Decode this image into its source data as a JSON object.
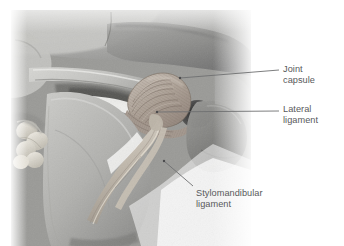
{
  "figure": {
    "kind": "anatomical-photograph",
    "background_color": "#ffffff",
    "label_color": "#58595b",
    "leader_color": "#6e6f71"
  },
  "labels": [
    {
      "id": "joint-capsule",
      "line1": "Joint",
      "line2": "capsule",
      "leader": {
        "x1": 180,
        "y1": 78,
        "x2": 279,
        "y2": 70
      }
    },
    {
      "id": "lateral-ligament",
      "line1": "Lateral",
      "line2": "ligament",
      "leader": {
        "x1": 157,
        "y1": 112,
        "x2": 279,
        "y2": 111
      }
    },
    {
      "id": "stylomandibular-ligament",
      "line1": "Stylomandibular",
      "line2": "ligament",
      "leader": {
        "x1": 164,
        "y1": 161,
        "x2": 193,
        "y2": 186
      }
    }
  ]
}
